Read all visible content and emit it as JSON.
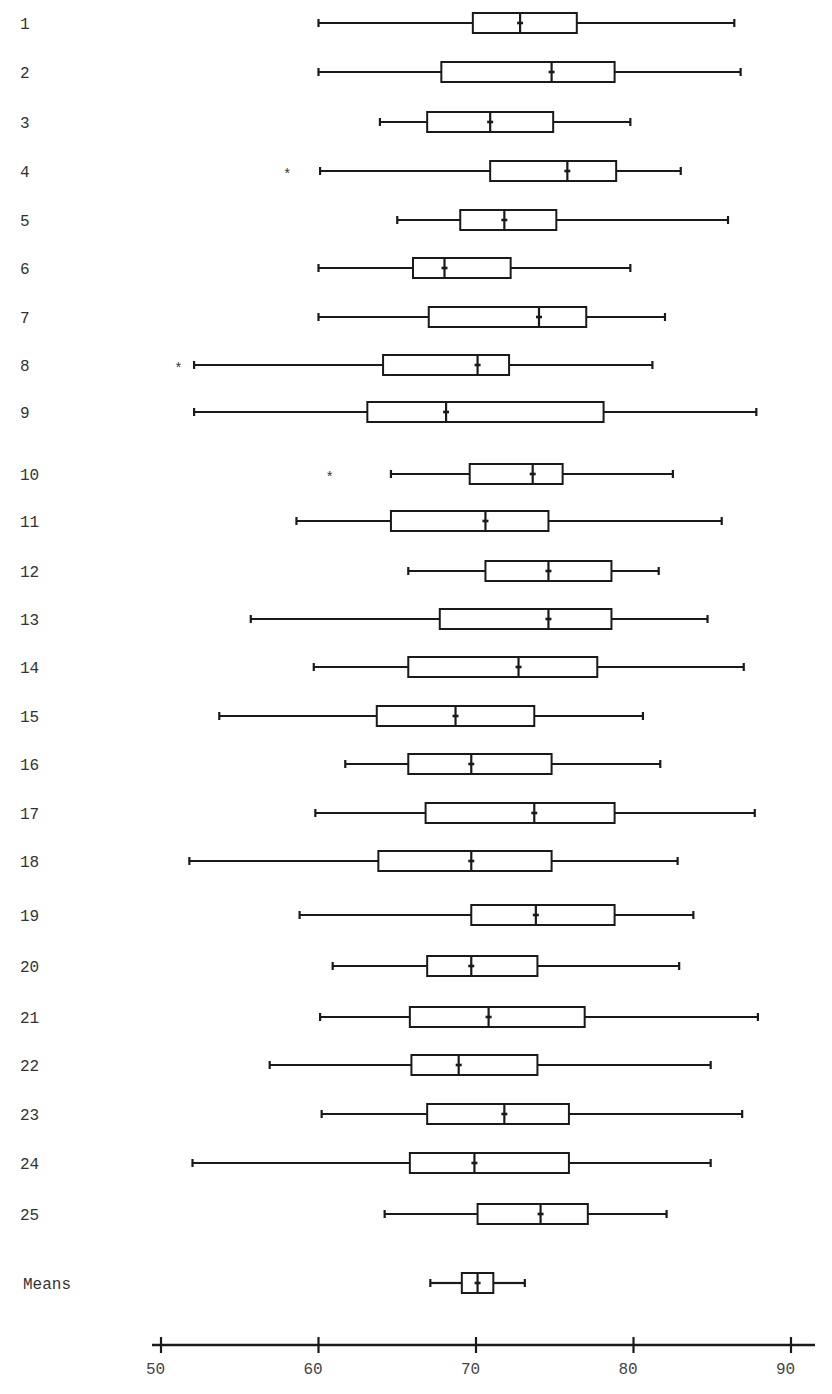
{
  "chart_data": {
    "type": "boxplot",
    "title": "",
    "xlabel": "",
    "ylabel": "",
    "orientation": "horizontal",
    "xlim": [
      49,
      92
    ],
    "xticks": [
      50,
      60,
      70,
      80,
      90
    ],
    "grid": false,
    "legend": null,
    "categories": [
      "1",
      "2",
      "3",
      "4",
      "5",
      "6",
      "7",
      "8",
      "9",
      "10",
      "11",
      "12",
      "13",
      "14",
      "15",
      "16",
      "17",
      "18",
      "19",
      "20",
      "21",
      "22",
      "23",
      "24",
      "25",
      "Means"
    ],
    "series": [
      {
        "label": "1",
        "y": 23,
        "min": 60.0,
        "q1": 69.8,
        "median": 72.8,
        "q3": 76.4,
        "max": 86.4,
        "outliers": []
      },
      {
        "label": "2",
        "y": 72,
        "min": 60.0,
        "q1": 67.8,
        "median": 74.8,
        "q3": 78.8,
        "max": 86.8,
        "outliers": []
      },
      {
        "label": "3",
        "y": 122,
        "min": 63.9,
        "q1": 66.9,
        "median": 70.9,
        "q3": 74.9,
        "max": 79.8,
        "outliers": []
      },
      {
        "label": "4",
        "y": 171,
        "min": 60.1,
        "q1": 70.9,
        "median": 75.8,
        "q3": 78.9,
        "max": 83.0,
        "outliers": [
          58.0
        ]
      },
      {
        "label": "5",
        "y": 220,
        "min": 65.0,
        "q1": 69.0,
        "median": 71.8,
        "q3": 75.1,
        "max": 86.0,
        "outliers": []
      },
      {
        "label": "6",
        "y": 268,
        "min": 60.0,
        "q1": 66.0,
        "median": 68.0,
        "q3": 72.2,
        "max": 79.8,
        "outliers": []
      },
      {
        "label": "7",
        "y": 317,
        "min": 60.0,
        "q1": 67.0,
        "median": 74.0,
        "q3": 77.0,
        "max": 82.0,
        "outliers": []
      },
      {
        "label": "8",
        "y": 365,
        "min": 52.1,
        "q1": 64.1,
        "median": 70.1,
        "q3": 72.1,
        "max": 81.2,
        "outliers": [
          51.1
        ]
      },
      {
        "label": "9",
        "y": 412,
        "min": 52.1,
        "q1": 63.1,
        "median": 68.1,
        "q3": 78.1,
        "max": 87.8,
        "outliers": []
      },
      {
        "label": "10",
        "y": 474,
        "min": 64.6,
        "q1": 69.6,
        "median": 73.6,
        "q3": 75.5,
        "max": 82.5,
        "outliers": [
          60.7
        ]
      },
      {
        "label": "11",
        "y": 521,
        "min": 58.6,
        "q1": 64.6,
        "median": 70.6,
        "q3": 74.6,
        "max": 85.6,
        "outliers": []
      },
      {
        "label": "12",
        "y": 571,
        "min": 65.7,
        "q1": 70.6,
        "median": 74.6,
        "q3": 78.6,
        "max": 81.6,
        "outliers": []
      },
      {
        "label": "13",
        "y": 619,
        "min": 55.7,
        "q1": 67.7,
        "median": 74.6,
        "q3": 78.6,
        "max": 84.7,
        "outliers": []
      },
      {
        "label": "14",
        "y": 667,
        "min": 59.7,
        "q1": 65.7,
        "median": 72.7,
        "q3": 77.7,
        "max": 87.0,
        "outliers": []
      },
      {
        "label": "15",
        "y": 716,
        "min": 53.7,
        "q1": 63.7,
        "median": 68.7,
        "q3": 73.7,
        "max": 80.6,
        "outliers": []
      },
      {
        "label": "16",
        "y": 764,
        "min": 61.7,
        "q1": 65.7,
        "median": 69.7,
        "q3": 74.8,
        "max": 81.7,
        "outliers": []
      },
      {
        "label": "17",
        "y": 813,
        "min": 59.8,
        "q1": 66.8,
        "median": 73.7,
        "q3": 78.8,
        "max": 87.7,
        "outliers": []
      },
      {
        "label": "18",
        "y": 861,
        "min": 51.8,
        "q1": 63.8,
        "median": 69.7,
        "q3": 74.8,
        "max": 82.8,
        "outliers": []
      },
      {
        "label": "19",
        "y": 915,
        "min": 58.8,
        "q1": 69.7,
        "median": 73.8,
        "q3": 78.8,
        "max": 83.8,
        "outliers": []
      },
      {
        "label": "20",
        "y": 966,
        "min": 60.9,
        "q1": 66.9,
        "median": 69.7,
        "q3": 73.9,
        "max": 82.9,
        "outliers": []
      },
      {
        "label": "21",
        "y": 1017,
        "min": 60.1,
        "q1": 65.8,
        "median": 70.8,
        "q3": 76.9,
        "max": 87.9,
        "outliers": []
      },
      {
        "label": "22",
        "y": 1065,
        "min": 56.9,
        "q1": 65.9,
        "median": 68.9,
        "q3": 73.9,
        "max": 84.9,
        "outliers": []
      },
      {
        "label": "23",
        "y": 1114,
        "min": 60.2,
        "q1": 66.9,
        "median": 71.8,
        "q3": 75.9,
        "max": 86.9,
        "outliers": []
      },
      {
        "label": "24",
        "y": 1163,
        "min": 52.0,
        "q1": 65.8,
        "median": 69.9,
        "q3": 75.9,
        "max": 84.9,
        "outliers": []
      },
      {
        "label": "25",
        "y": 1214,
        "min": 64.2,
        "q1": 70.1,
        "median": 74.1,
        "q3": 77.1,
        "max": 82.1,
        "outliers": []
      },
      {
        "label": "Means",
        "y": 1283,
        "min": 67.1,
        "q1": 69.1,
        "median": 70.1,
        "q3": 71.1,
        "max": 73.1,
        "outliers": []
      }
    ]
  },
  "layout": {
    "x_px_at_50": 161,
    "px_per_unit": 15.75,
    "axis_y": 1345,
    "axis_x_start": 152,
    "axis_x_end": 815,
    "label_x": 20,
    "box_height": 18,
    "means_box_height": 18,
    "outlier_symbol": "*",
    "stroke_color": "#1a1a1a"
  },
  "caption": {
    "text": ""
  }
}
